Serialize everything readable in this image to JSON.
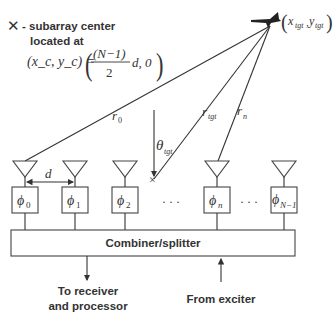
{
  "legend": {
    "marker": "✕",
    "line1": "- subarray center",
    "line2": "located at",
    "equation_lhs": "(x_c, y_c) =",
    "equation_num": "(N−1)",
    "equation_den": "2",
    "equation_tail": "d, 0"
  },
  "target": {
    "icon": "airplane-icon",
    "label_x": "x",
    "label_x_sub": "tgt",
    "label_y": "y",
    "label_y_sub": "tgt"
  },
  "rays": {
    "r0": {
      "main": "r",
      "sub": "0"
    },
    "rtgt": {
      "main": "r",
      "sub": "tgt"
    },
    "rn": {
      "main": "r",
      "sub": "n"
    },
    "theta": {
      "main": "θ",
      "sub": "tgt"
    }
  },
  "spacing_label": "d",
  "elements": [
    {
      "phase": "ϕ",
      "sub": "0"
    },
    {
      "phase": "ϕ",
      "sub": "1"
    },
    {
      "phase": "ϕ",
      "sub": "2"
    },
    {
      "phase": "ϕ",
      "sub": "n"
    },
    {
      "phase": "ϕ",
      "sub": "N−1"
    }
  ],
  "ellipsis": "· · ·",
  "combiner": {
    "label": "Combiner/splitter"
  },
  "outputs": {
    "receiver_line1": "To receiver",
    "receiver_line2": "and processor",
    "exciter": "From exciter"
  }
}
